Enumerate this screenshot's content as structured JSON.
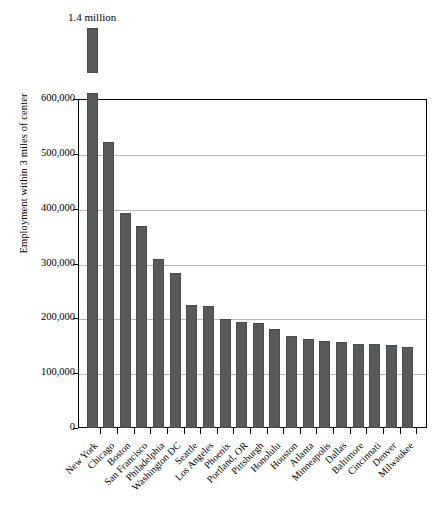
{
  "chart_data": {
    "type": "bar",
    "title": "",
    "xlabel": "",
    "ylabel": "Employment within 3 miles of center",
    "ylim": [
      0,
      600000
    ],
    "ytick_labels": [
      "600,000",
      "500,000",
      "400,000",
      "300,000",
      "200,000",
      "100,000",
      "0"
    ],
    "ytick_values": [
      600000,
      500000,
      400000,
      300000,
      200000,
      100000,
      0
    ],
    "grid": true,
    "legend": "none",
    "broken_axis": true,
    "annotations": [
      {
        "text": "1.4 million",
        "category": "New York",
        "note": "New York bar is truncated; a detached segment above the plot frame represents its full value of about 1.4 million."
      }
    ],
    "categories": [
      "New York",
      "Chicago",
      "Boston",
      "San Francisco",
      "Philadelphia",
      "Washington DC",
      "Seattle",
      "Los Angeles",
      "Phoenix",
      "Portland, OR",
      "Pittsburgh",
      "Honolulu",
      "Houston",
      "Atlanta",
      "Minneapolis",
      "Dallas",
      "Baltimore",
      "Cincinnati",
      "Denver",
      "Milwaukee"
    ],
    "values": [
      1400000,
      522000,
      392000,
      368000,
      308000,
      283000,
      224000,
      222000,
      199000,
      194000,
      192000,
      180000,
      168000,
      162000,
      158000,
      157000,
      154000,
      153000,
      152000,
      147000
    ],
    "value_display": [
      "1.4 million",
      "522,000",
      "392,000",
      "368,000",
      "308,000",
      "283,000",
      "224,000",
      "222,000",
      "199,000",
      "194,000",
      "192,000",
      "180,000",
      "168,000",
      "162,000",
      "158,000",
      "157,000",
      "154,000",
      "153,000",
      "152,000",
      "147,000"
    ],
    "bar_color": "#58595b",
    "gridline_color": "#b9b9b9",
    "axis_color": "#000000"
  }
}
